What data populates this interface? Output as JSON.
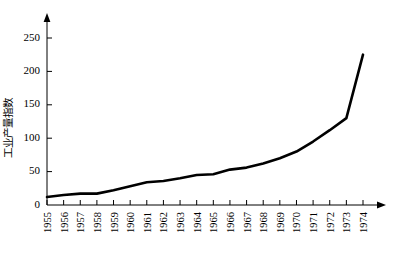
{
  "chart_data": {
    "type": "line",
    "title": "",
    "xlabel": "",
    "ylabel": "工业产量指数",
    "categories": [
      "1955",
      "1956",
      "1957",
      "1958",
      "1959",
      "1960",
      "1961",
      "1962",
      "1963",
      "1964",
      "1965",
      "1966",
      "1967",
      "1968",
      "1969",
      "1970",
      "1971",
      "1972",
      "1973",
      "1974"
    ],
    "values": [
      12,
      15,
      17,
      17,
      22,
      28,
      34,
      36,
      40,
      45,
      46,
      53,
      56,
      62,
      70,
      80,
      95,
      112,
      130,
      225
    ],
    "x": [
      1955,
      1956,
      1957,
      1958,
      1959,
      1960,
      1961,
      1962,
      1963,
      1964,
      1965,
      1966,
      1967,
      1968,
      1969,
      1970,
      1971,
      1972,
      1973,
      1974
    ],
    "xlim": [
      1955,
      1974
    ],
    "ylim": [
      0,
      250
    ],
    "yticks": [
      0,
      50,
      100,
      150,
      200,
      250
    ],
    "ytick_labels": [
      "0",
      "50",
      "100",
      "150",
      "200",
      "250"
    ],
    "grid": false,
    "legend": null,
    "series_color": "#000000",
    "axis_color": "#000000",
    "background": "#ffffff",
    "annotations": []
  }
}
